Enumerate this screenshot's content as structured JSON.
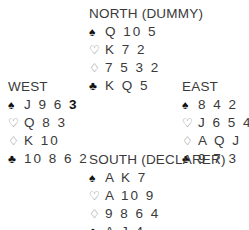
{
  "north": {
    "title": "NORTH (DUMMY)",
    "spades": "Q 10 5",
    "hearts": "K 7 2",
    "diamonds": "7 5 3 2",
    "clubs": "K Q 5"
  },
  "west": {
    "title": "WEST",
    "spades_prefix": "J 9 6 ",
    "spades_highlight": "3",
    "hearts": "Q 8 3",
    "diamonds": "K 10",
    "clubs": "10 8 6 2"
  },
  "east": {
    "title": "EAST",
    "spades": "8 4 2",
    "hearts": "J 6 5 4",
    "diamonds": "A Q J",
    "clubs": "9 7 3"
  },
  "south": {
    "title": "SOUTH (DECLARER)",
    "spades": "A K 7",
    "hearts": "A 10 9",
    "diamonds": "9 8 6 4",
    "clubs": "A J 4"
  },
  "icons": {
    "spade": "♠",
    "heart": "♡",
    "diamond": "♢",
    "club": "♣"
  }
}
